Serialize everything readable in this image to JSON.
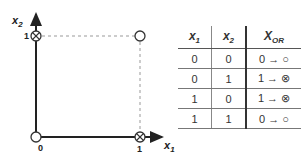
{
  "plot": {
    "x_axis_label": "x",
    "x_axis_sub": "1",
    "y_axis_label": "x",
    "y_axis_sub": "2",
    "x_ticks": [
      "0",
      "1"
    ],
    "y_ticks": [
      "1"
    ],
    "points": [
      {
        "x": 0,
        "y": 0,
        "marker": "circle"
      },
      {
        "x": 0,
        "y": 1,
        "marker": "circle-cross"
      },
      {
        "x": 1,
        "y": 0,
        "marker": "circle-cross"
      },
      {
        "x": 1,
        "y": 1,
        "marker": "circle"
      }
    ]
  },
  "table": {
    "headers": [
      {
        "main": "x",
        "sub": "1"
      },
      {
        "main": "x",
        "sub": "2"
      },
      {
        "main": "X",
        "sub": "OR"
      }
    ],
    "rows": [
      [
        "0",
        "0",
        "0 → ○"
      ],
      [
        "0",
        "1",
        "1 → ⊗"
      ],
      [
        "1",
        "0",
        "1 → ⊗"
      ],
      [
        "1",
        "1",
        "0 → ○"
      ]
    ]
  },
  "colors": {
    "axis": "#222222",
    "guide": "#999999"
  }
}
